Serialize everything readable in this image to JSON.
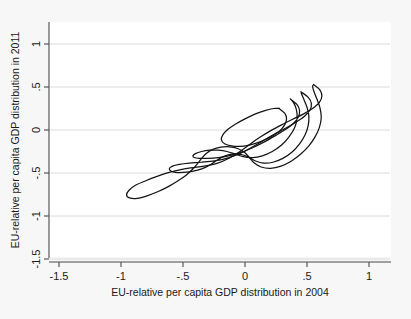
{
  "chart_data": {
    "type": "line",
    "subtype": "contour",
    "title": "",
    "xlabel": "EU-relative per capita GDP distribution in 2004",
    "ylabel": "EU-relative per capita GDP distribution in 2011",
    "xlim": [
      -1.65,
      1.2
    ],
    "ylim": [
      -1.65,
      1.2
    ],
    "xticks": [
      -1.5,
      -1,
      -0.5,
      0,
      0.5,
      1
    ],
    "xticklabels": [
      "-1.5",
      "-1",
      "-.5",
      "0",
      ".5",
      "1"
    ],
    "yticks": [
      -1.5,
      -1,
      -0.5,
      0,
      0.5,
      1
    ],
    "yticklabels": [
      "-1.5",
      "-1",
      "-.5",
      "0",
      ".5",
      "1"
    ],
    "grid": "horizontal",
    "legend": "none",
    "n_contour_levels": 4,
    "mode_center": [
      0.09,
      0.06
    ],
    "contours": [
      {
        "level": 1,
        "label": "outermost",
        "points": [
          [
            0.555,
            0.525
          ],
          [
            0.605,
            0.465
          ],
          [
            0.62,
            0.395
          ],
          [
            0.6,
            0.32
          ],
          [
            0.545,
            0.25
          ],
          [
            0.47,
            0.185
          ],
          [
            0.385,
            0.125
          ],
          [
            0.295,
            0.06
          ],
          [
            0.205,
            -0.01
          ],
          [
            0.12,
            -0.085
          ],
          [
            0.04,
            -0.165
          ],
          [
            -0.04,
            -0.25
          ],
          [
            -0.125,
            -0.325
          ],
          [
            -0.22,
            -0.385
          ],
          [
            -0.33,
            -0.42
          ],
          [
            -0.44,
            -0.44
          ],
          [
            -0.545,
            -0.47
          ],
          [
            -0.64,
            -0.505
          ],
          [
            -0.72,
            -0.545
          ],
          [
            -0.8,
            -0.59
          ],
          [
            -0.88,
            -0.64
          ],
          [
            -0.935,
            -0.7
          ],
          [
            -0.955,
            -0.755
          ],
          [
            -0.93,
            -0.79
          ],
          [
            -0.87,
            -0.795
          ],
          [
            -0.79,
            -0.765
          ],
          [
            -0.7,
            -0.715
          ],
          [
            -0.615,
            -0.655
          ],
          [
            -0.54,
            -0.59
          ],
          [
            -0.475,
            -0.525
          ],
          [
            -0.425,
            -0.46
          ],
          [
            -0.385,
            -0.395
          ],
          [
            -0.35,
            -0.33
          ],
          [
            -0.31,
            -0.27
          ],
          [
            -0.26,
            -0.225
          ],
          [
            -0.195,
            -0.2
          ],
          [
            -0.125,
            -0.195
          ],
          [
            -0.06,
            -0.215
          ],
          [
            -0.005,
            -0.26
          ],
          [
            0.035,
            -0.32
          ],
          [
            0.075,
            -0.385
          ],
          [
            0.13,
            -0.43
          ],
          [
            0.205,
            -0.445
          ],
          [
            0.29,
            -0.42
          ],
          [
            0.375,
            -0.36
          ],
          [
            0.45,
            -0.28
          ],
          [
            0.515,
            -0.185
          ],
          [
            0.565,
            -0.08
          ],
          [
            0.6,
            0.03
          ],
          [
            0.615,
            0.145
          ],
          [
            0.605,
            0.255
          ],
          [
            0.58,
            0.36
          ],
          [
            0.555,
            0.45
          ],
          [
            0.545,
            0.51
          ],
          [
            0.555,
            0.525
          ]
        ]
      },
      {
        "level": 2,
        "label": "second",
        "points": [
          [
            0.455,
            0.44
          ],
          [
            0.51,
            0.38
          ],
          [
            0.535,
            0.31
          ],
          [
            0.525,
            0.235
          ],
          [
            0.48,
            0.16
          ],
          [
            0.41,
            0.09
          ],
          [
            0.325,
            0.02
          ],
          [
            0.235,
            -0.05
          ],
          [
            0.145,
            -0.125
          ],
          [
            0.055,
            -0.2
          ],
          [
            -0.035,
            -0.27
          ],
          [
            -0.135,
            -0.325
          ],
          [
            -0.245,
            -0.36
          ],
          [
            -0.355,
            -0.375
          ],
          [
            -0.45,
            -0.385
          ],
          [
            -0.53,
            -0.4
          ],
          [
            -0.585,
            -0.42
          ],
          [
            -0.61,
            -0.45
          ],
          [
            -0.595,
            -0.48
          ],
          [
            -0.545,
            -0.495
          ],
          [
            -0.47,
            -0.49
          ],
          [
            -0.39,
            -0.47
          ],
          [
            -0.32,
            -0.435
          ],
          [
            -0.265,
            -0.39
          ],
          [
            -0.215,
            -0.34
          ],
          [
            -0.16,
            -0.3
          ],
          [
            -0.095,
            -0.28
          ],
          [
            -0.03,
            -0.285
          ],
          [
            0.03,
            -0.315
          ],
          [
            0.085,
            -0.36
          ],
          [
            0.15,
            -0.385
          ],
          [
            0.225,
            -0.375
          ],
          [
            0.305,
            -0.33
          ],
          [
            0.38,
            -0.255
          ],
          [
            0.44,
            -0.16
          ],
          [
            0.485,
            -0.055
          ],
          [
            0.51,
            0.055
          ],
          [
            0.515,
            0.165
          ],
          [
            0.5,
            0.265
          ],
          [
            0.475,
            0.355
          ],
          [
            0.455,
            0.425
          ],
          [
            0.455,
            0.44
          ]
        ]
      },
      {
        "level": 3,
        "label": "third",
        "points": [
          [
            0.37,
            0.355
          ],
          [
            0.42,
            0.295
          ],
          [
            0.44,
            0.225
          ],
          [
            0.43,
            0.15
          ],
          [
            0.39,
            0.075
          ],
          [
            0.325,
            0.005
          ],
          [
            0.245,
            -0.065
          ],
          [
            0.16,
            -0.135
          ],
          [
            0.07,
            -0.2
          ],
          [
            -0.02,
            -0.255
          ],
          [
            -0.115,
            -0.295
          ],
          [
            -0.215,
            -0.32
          ],
          [
            -0.305,
            -0.33
          ],
          [
            -0.37,
            -0.33
          ],
          [
            -0.41,
            -0.32
          ],
          [
            -0.42,
            -0.3
          ],
          [
            -0.4,
            -0.275
          ],
          [
            -0.35,
            -0.25
          ],
          [
            -0.285,
            -0.235
          ],
          [
            -0.215,
            -0.235
          ],
          [
            -0.145,
            -0.25
          ],
          [
            -0.08,
            -0.28
          ],
          [
            -0.015,
            -0.31
          ],
          [
            0.06,
            -0.32
          ],
          [
            0.14,
            -0.3
          ],
          [
            0.22,
            -0.25
          ],
          [
            0.295,
            -0.175
          ],
          [
            0.355,
            -0.08
          ],
          [
            0.4,
            0.025
          ],
          [
            0.42,
            0.135
          ],
          [
            0.415,
            0.235
          ],
          [
            0.395,
            0.31
          ],
          [
            0.37,
            0.355
          ]
        ]
      },
      {
        "level": 4,
        "label": "innermost",
        "points": [
          [
            0.275,
            0.25
          ],
          [
            0.32,
            0.195
          ],
          [
            0.335,
            0.13
          ],
          [
            0.32,
            0.06
          ],
          [
            0.28,
            -0.01
          ],
          [
            0.215,
            -0.075
          ],
          [
            0.135,
            -0.13
          ],
          [
            0.05,
            -0.17
          ],
          [
            -0.035,
            -0.19
          ],
          [
            -0.11,
            -0.185
          ],
          [
            -0.165,
            -0.16
          ],
          [
            -0.19,
            -0.115
          ],
          [
            -0.18,
            -0.06
          ],
          [
            -0.14,
            0.005
          ],
          [
            -0.075,
            0.07
          ],
          [
            0.0,
            0.13
          ],
          [
            0.08,
            0.185
          ],
          [
            0.16,
            0.225
          ],
          [
            0.23,
            0.25
          ],
          [
            0.275,
            0.25
          ]
        ]
      }
    ]
  },
  "axes": {
    "x_title": "EU-relative per capita GDP distribution in 2004",
    "y_title": "EU-relative per capita GDP distribution in 2011",
    "x_tick_labels": [
      "-1.5",
      "-1",
      "-.5",
      "0",
      ".5",
      "1"
    ],
    "y_tick_labels": [
      "1",
      ".5",
      "0",
      "-.5",
      "-1",
      "-1.5"
    ]
  },
  "colors": {
    "background": "#f7f7f7",
    "plot_area": "#ffffff",
    "axis": "#4a4a4a",
    "gridline": "#dcdcdc",
    "contour": "#141414",
    "text": "#1a1a1a"
  }
}
